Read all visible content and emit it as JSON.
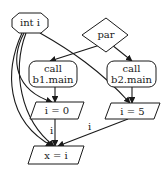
{
  "diagram": {
    "type": "flow-graph",
    "colors": {
      "stroke": "#1a1a1a",
      "fill": "#ffffff",
      "text": "#1a1a1a"
    },
    "nodes": {
      "int_i": {
        "id": "int_i",
        "shape": "octagon",
        "label": "int i"
      },
      "par": {
        "id": "par",
        "shape": "diamond",
        "label": "par"
      },
      "call_b1": {
        "id": "call_b1",
        "shape": "rounded-rect",
        "line1": "call",
        "line2": "b1.main"
      },
      "call_b2": {
        "id": "call_b2",
        "shape": "rounded-rect",
        "line1": "call",
        "line2": "b2.main"
      },
      "assign_i0": {
        "id": "assign_i0",
        "shape": "parallelogram",
        "label": "i = 0"
      },
      "assign_i5": {
        "id": "assign_i5",
        "shape": "parallelogram",
        "label": "i = 5"
      },
      "assign_x": {
        "id": "assign_x",
        "shape": "parallelogram",
        "label": "x = i"
      }
    },
    "edges": [
      {
        "from": "par",
        "to": "call_b1",
        "label": ""
      },
      {
        "from": "par",
        "to": "call_b2",
        "label": ""
      },
      {
        "from": "call_b1",
        "to": "assign_i0",
        "label": ""
      },
      {
        "from": "call_b2",
        "to": "assign_i5",
        "label": ""
      },
      {
        "from": "int_i",
        "to": "assign_i0",
        "label": ""
      },
      {
        "from": "int_i",
        "to": "assign_i5",
        "label": ""
      },
      {
        "from": "int_i",
        "to": "assign_x",
        "label": ""
      },
      {
        "from": "int_i",
        "to": "assign_x",
        "label": ""
      },
      {
        "from": "assign_i0",
        "to": "assign_x",
        "label": "i"
      },
      {
        "from": "assign_i5",
        "to": "assign_x",
        "label": "i"
      }
    ],
    "edge_labels": {
      "i0_to_x": "i",
      "i5_to_x": "i"
    }
  }
}
